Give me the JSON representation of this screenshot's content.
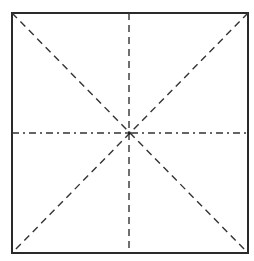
{
  "diagram": {
    "square": {
      "x1": 12,
      "y1": 13,
      "x2": 248,
      "y2": 253
    },
    "center": {
      "x": 129,
      "y": 133
    },
    "colors": {
      "background": "#ffffff",
      "stroke": "#2a2a2a",
      "dashed": "#333333"
    },
    "lines": [
      {
        "name": "diagonal-tl-br",
        "style": "dashed"
      },
      {
        "name": "diagonal-tr-bl",
        "style": "dashed"
      },
      {
        "name": "vertical-midline",
        "style": "dashed"
      },
      {
        "name": "horizontal-midline",
        "style": "dash-dot"
      }
    ]
  }
}
